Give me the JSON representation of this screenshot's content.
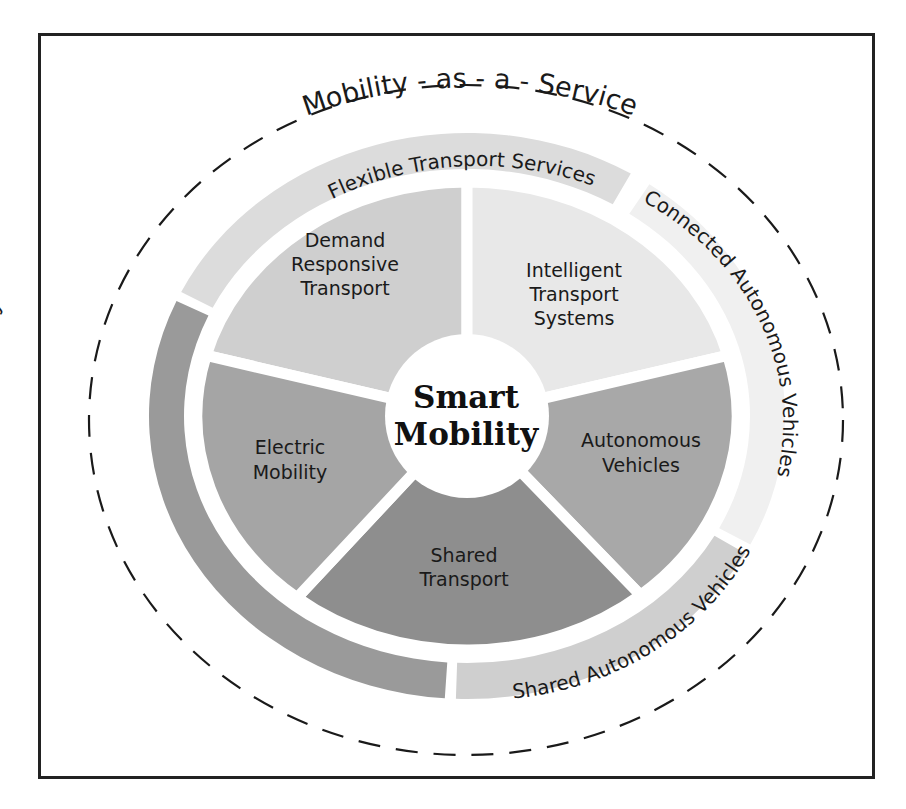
{
  "diagram": {
    "outer_title": "Mobility - as - a - Service",
    "center": {
      "line1": "Smart",
      "line2": "Mobility"
    },
    "segments": [
      {
        "id": "drt",
        "lines": [
          "Demand",
          "Responsive",
          "Transport"
        ],
        "color": "#cfcfcf"
      },
      {
        "id": "its",
        "lines": [
          "Intelligent",
          "Transport",
          "Systems"
        ],
        "color": "#e8e8e8"
      },
      {
        "id": "av",
        "lines": [
          "Autonomous",
          "Vehicles"
        ],
        "color": "#a8a8a8"
      },
      {
        "id": "shared",
        "lines": [
          "Shared",
          "Transport"
        ],
        "color": "#8e8e8e"
      },
      {
        "id": "electric",
        "lines": [
          "Electric",
          "Mobility"
        ],
        "color": "#a5a5a5"
      }
    ],
    "bands": [
      {
        "id": "flexible",
        "label": "Flexible Transport Services",
        "color": "#dcdcdc"
      },
      {
        "id": "connected",
        "label": "Connected Autonomous Vehicles",
        "color": "#f0f0f0"
      },
      {
        "id": "shared-av",
        "label": "Shared Autonomous Vehicles",
        "color": "#cfcfcf"
      },
      {
        "id": "free-floating",
        "label": "Free-Floating E-Mobility",
        "color": "#9a9a9a"
      }
    ],
    "colors": {
      "frame": "#222222",
      "dashes": "#1a1a1a",
      "gap": "#ffffff"
    }
  }
}
